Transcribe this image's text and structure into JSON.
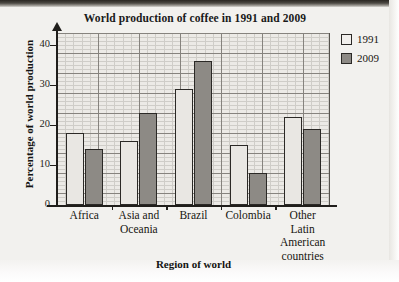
{
  "chart_data": {
    "type": "bar",
    "title": "World production of coffee in 1991 and 2009",
    "xlabel": "Region of world",
    "ylabel": "Percentage of world production",
    "categories": [
      "Africa",
      "Asia and Oceania",
      "Brazil",
      "Colombia",
      "Other Latin American countries"
    ],
    "category_lines": [
      [
        "Africa"
      ],
      [
        "Asia and",
        "Oceania"
      ],
      [
        "Brazil"
      ],
      [
        "Colombia"
      ],
      [
        "Other",
        "Latin",
        "American",
        "countries"
      ]
    ],
    "series": [
      {
        "name": "1991",
        "color": "#e9e7e3",
        "values": [
          18,
          16,
          29,
          15,
          22
        ]
      },
      {
        "name": "2009",
        "color": "#8d8a85",
        "values": [
          14,
          23,
          36,
          8,
          19
        ]
      }
    ],
    "ylim": [
      0,
      43
    ],
    "y_ticks": [
      0,
      10,
      20,
      30,
      40
    ],
    "y_tick_labels": [
      "0",
      "10",
      "20",
      "30",
      "40"
    ],
    "grid": true,
    "grid_minor_step": 1,
    "grid_major_step": 5,
    "legend_position": "top-right"
  },
  "legend": {
    "entries": [
      {
        "label": "1991",
        "swatch": "#e9e7e3"
      },
      {
        "label": "2009",
        "swatch": "#8d8a85"
      }
    ]
  }
}
